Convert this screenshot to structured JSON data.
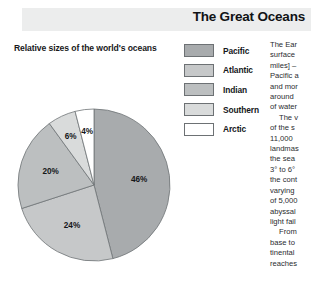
{
  "header": {
    "title": "The Great Oceans",
    "band_color": "#eceded"
  },
  "subtitle": "Relative sizes of the world's oceans",
  "legend": {
    "items": [
      {
        "label": "Pacific",
        "color": "#a8abad"
      },
      {
        "label": "Atlantic",
        "color": "#c6c8c9"
      },
      {
        "label": "Indian",
        "color": "#bcbfc0"
      },
      {
        "label": "Southern",
        "color": "#d9dbdb"
      },
      {
        "label": "Arctic",
        "color": "#ffffff"
      }
    ]
  },
  "chart_data": {
    "type": "pie",
    "title": "Relative sizes of the world's oceans",
    "categories": [
      "Pacific",
      "Atlantic",
      "Indian",
      "Southern",
      "Arctic"
    ],
    "values": [
      46,
      24,
      20,
      6,
      4
    ],
    "unit": "%",
    "labels": [
      "46%",
      "24%",
      "20%",
      "6%",
      "4%"
    ],
    "colors": [
      "#a8abad",
      "#c6c8c9",
      "#bcbfc0",
      "#d9dbdb",
      "#ffffff"
    ],
    "start_angle_deg": 0,
    "direction": "clockwise",
    "legend_position": "right",
    "grid": false,
    "xlabel": "",
    "ylabel": ""
  },
  "article": {
    "paragraphs": [
      "The Ear surface miles] – Pacific a and mor around of water",
      "The v of the s 11,000 landmas the sea 3° to 6° the cont varying of 5,000 abyssal light fail",
      "From base to tinental reaches"
    ],
    "lines": [
      "The Ear",
      "surface",
      "miles] –",
      "Pacific a",
      "and mor",
      "around",
      "of water",
      "The v",
      "of the s",
      "11,000",
      "landmas",
      "the sea",
      "3° to 6°",
      "the cont",
      "varying",
      "of 5,000",
      "abyssal",
      "light fail",
      "From",
      "base to",
      "tinental",
      "reaches"
    ]
  }
}
